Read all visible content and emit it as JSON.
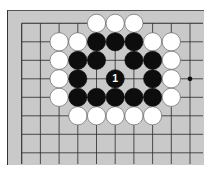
{
  "board": {
    "background": "#c9c9c9",
    "line_color": "#2a2a2a",
    "origin_x": 21.7,
    "origin_y": 23.3,
    "spacing_x": 18.7,
    "spacing_y": 18.5,
    "columns": 10,
    "rows": 8,
    "extend_right_to": 203,
    "extend_bottom_to": 164
  },
  "star_points": [
    {
      "col": 9,
      "row": 3
    }
  ],
  "stones": [
    {
      "col": 4,
      "row": 0,
      "color": "white"
    },
    {
      "col": 5,
      "row": 0,
      "color": "white"
    },
    {
      "col": 6,
      "row": 0,
      "color": "white"
    },
    {
      "col": 2,
      "row": 1,
      "color": "white"
    },
    {
      "col": 3,
      "row": 1,
      "color": "white"
    },
    {
      "col": 4,
      "row": 1,
      "color": "black"
    },
    {
      "col": 5,
      "row": 1,
      "color": "black"
    },
    {
      "col": 6,
      "row": 1,
      "color": "black"
    },
    {
      "col": 7,
      "row": 1,
      "color": "white"
    },
    {
      "col": 8,
      "row": 1,
      "color": "white"
    },
    {
      "col": 2,
      "row": 2,
      "color": "white"
    },
    {
      "col": 3,
      "row": 2,
      "color": "black"
    },
    {
      "col": 4,
      "row": 2,
      "color": "black"
    },
    {
      "col": 6,
      "row": 2,
      "color": "black"
    },
    {
      "col": 7,
      "row": 2,
      "color": "black"
    },
    {
      "col": 8,
      "row": 2,
      "color": "white"
    },
    {
      "col": 2,
      "row": 3,
      "color": "white"
    },
    {
      "col": 3,
      "row": 3,
      "color": "black"
    },
    {
      "col": 5,
      "row": 3,
      "color": "black",
      "label": "1"
    },
    {
      "col": 7,
      "row": 3,
      "color": "black"
    },
    {
      "col": 8,
      "row": 3,
      "color": "white"
    },
    {
      "col": 2,
      "row": 4,
      "color": "white"
    },
    {
      "col": 3,
      "row": 4,
      "color": "black"
    },
    {
      "col": 4,
      "row": 4,
      "color": "black"
    },
    {
      "col": 5,
      "row": 4,
      "color": "black"
    },
    {
      "col": 6,
      "row": 4,
      "color": "black"
    },
    {
      "col": 7,
      "row": 4,
      "color": "black"
    },
    {
      "col": 8,
      "row": 4,
      "color": "white"
    },
    {
      "col": 3,
      "row": 5,
      "color": "white"
    },
    {
      "col": 4,
      "row": 5,
      "color": "white"
    },
    {
      "col": 5,
      "row": 5,
      "color": "white"
    },
    {
      "col": 6,
      "row": 5,
      "color": "white"
    },
    {
      "col": 7,
      "row": 5,
      "color": "white"
    }
  ],
  "move_label": "1"
}
